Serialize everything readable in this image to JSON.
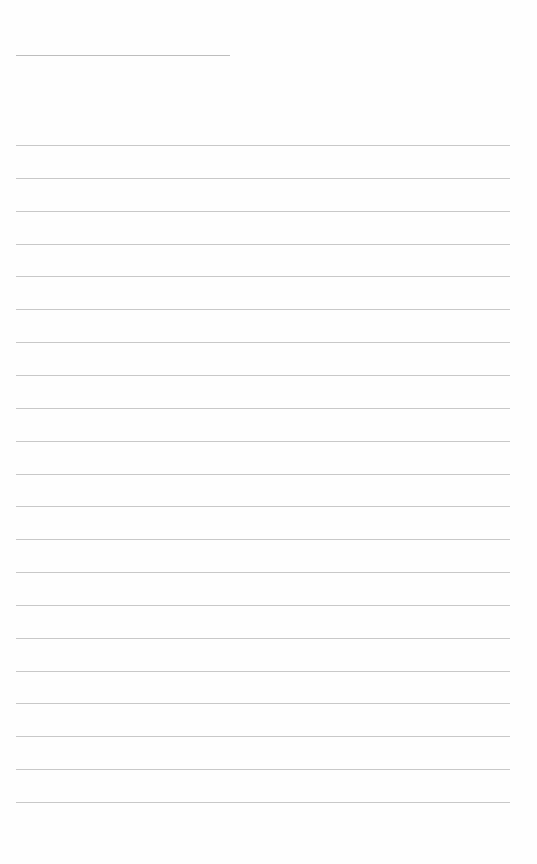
{
  "document": {
    "type": "lined-paper",
    "background": "#fefefe",
    "line_color": "#c8c8c8",
    "header_line": {
      "x1": 16,
      "x2": 230,
      "y": 55,
      "color": "#bdbdbd"
    },
    "rules": {
      "count": 21,
      "x1": 16,
      "x2": 510,
      "first_y": 145,
      "spacing": 32.85
    }
  }
}
